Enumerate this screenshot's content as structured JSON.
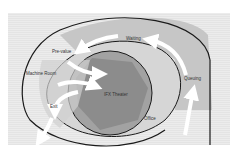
{
  "diagram": {
    "labels": {
      "pre_value": "Pre-value",
      "waiting": "Waiting",
      "machine_room": "Machine Room",
      "theater": "IFX Theater",
      "queuing": "Queuing",
      "exit": "Exit",
      "office": "Office"
    },
    "colors": {
      "background": "#ebebeb",
      "outer_band": "#c4c4c4",
      "inner_disc": "#9a9a9a",
      "hexagon": "#8a8a8a",
      "light_band": "#d8d8d8",
      "outline": "#1a1a1a",
      "arrow": "#ffffff"
    }
  }
}
